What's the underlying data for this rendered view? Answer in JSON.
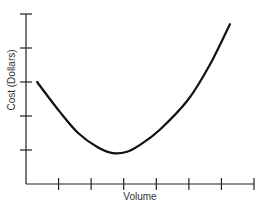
{
  "chart_data": {
    "type": "line",
    "title": "",
    "xlabel": "Volume",
    "ylabel": "Cost (Dollars)",
    "x_ticks": 7,
    "y_ticks": 5,
    "xlim": [
      0,
      7
    ],
    "ylim": [
      0,
      5
    ],
    "tick_labels_shown": false,
    "grid": false,
    "legend": null,
    "series": [
      {
        "name": "Cost curve",
        "x": [
          0.34,
          1.04,
          1.6,
          2.2,
          2.67,
          3.1,
          3.5,
          4.1,
          4.97,
          5.64,
          6.26
        ],
        "y": [
          3.0,
          2.12,
          1.5,
          1.08,
          0.91,
          0.95,
          1.15,
          1.59,
          2.47,
          3.5,
          4.7
        ]
      }
    ],
    "colors": {
      "axis": "#222222",
      "line": "#111111",
      "text": "#333333"
    }
  }
}
